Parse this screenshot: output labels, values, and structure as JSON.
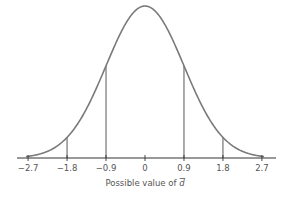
{
  "chart_data": {
    "type": "line",
    "title": "",
    "xlabel": "Possible value of d̄",
    "xlabel_text": "Possible value of ",
    "xlabel_symbol": "d",
    "ylabel": "",
    "xlim": [
      -2.97,
      2.97
    ],
    "x_ticks": [
      -2.7,
      -1.8,
      -0.9,
      0,
      0.9,
      1.8,
      2.7
    ],
    "x_tick_labels": [
      "−2.7",
      "−1.8",
      "−0.9",
      "0",
      "0.9",
      "1.8",
      "2.7"
    ],
    "curve": "normal density, mean 0, sd 0.9",
    "mean": 0,
    "sd": 0.9,
    "reference_lines_x": [
      -1.8,
      -0.9,
      0.9,
      1.8
    ],
    "grid": false,
    "legend": null,
    "colors": {
      "curve": "#7a7a7a",
      "axis": "#333333",
      "lines": "#444444"
    }
  }
}
